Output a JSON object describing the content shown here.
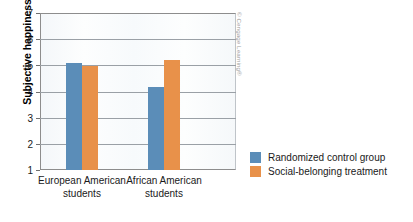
{
  "chart_data": {
    "type": "bar",
    "title": "",
    "xlabel": "",
    "ylabel": "Subjective happiness",
    "ylim": [
      1,
      7
    ],
    "yticks": [
      1,
      2,
      3,
      4,
      5,
      6,
      7
    ],
    "ytick_labels": [
      "1",
      "2",
      "3",
      "4",
      "5",
      "6",
      "7"
    ],
    "grid": true,
    "legend_position": "right",
    "categories": [
      "European American\nstudents",
      "African American\nstudents"
    ],
    "category_lines": [
      [
        "European American",
        "students"
      ],
      [
        "African American",
        "students"
      ]
    ],
    "series": [
      {
        "name": "Randomized control group",
        "color": "#5b8db8",
        "values": [
          5.08,
          4.17
        ]
      },
      {
        "name": "Social-belonging treatment",
        "color": "#e8914a",
        "values": [
          4.98,
          5.2
        ]
      }
    ]
  },
  "credit": "© Cengage Learning®",
  "legend": {
    "items": [
      {
        "label": "Randomized control group",
        "color": "#5b8db8"
      },
      {
        "label": "Social-belonging treatment",
        "color": "#e8914a"
      }
    ]
  }
}
